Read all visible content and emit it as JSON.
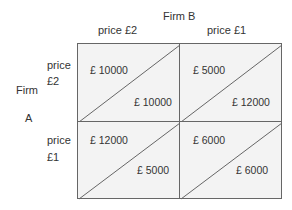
{
  "title_col_player": "Firm B",
  "col_strategies": [
    "price £2",
    "price £1"
  ],
  "row_player": {
    "line1": "Firm",
    "line2": "A"
  },
  "row_strategies": [
    {
      "line1": "price",
      "line2": "£2"
    },
    {
      "line1": "price",
      "line2": "£1"
    }
  ],
  "cells": [
    [
      {
        "a": "£ 10000",
        "b": "£ 10000"
      },
      {
        "a": "£ 5000",
        "b": "£ 12000"
      }
    ],
    [
      {
        "a": "£ 12000",
        "b": "£ 5000"
      },
      {
        "a": "£ 6000",
        "b": "£ 6000"
      }
    ]
  ],
  "colors": {
    "cell_fill": "#f3f3f3",
    "grid_line": "#666666",
    "text": "#333333"
  }
}
